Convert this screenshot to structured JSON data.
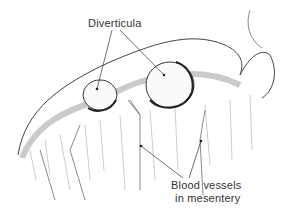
{
  "diagram": {
    "labels": {
      "diverticula": "Diverticula",
      "blood_vessels_line1": "Blood vessels",
      "blood_vessels_line2": "in mesentery"
    },
    "colors": {
      "ink": "#333333",
      "background": "#ffffff"
    }
  }
}
